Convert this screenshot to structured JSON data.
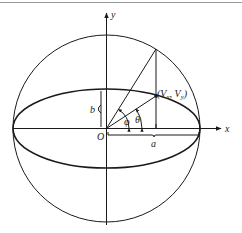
{
  "figure": {
    "type": "geometry-diagram",
    "colors": {
      "ink": "#1a1a1a",
      "background": "#ffffff",
      "top_rule": "#9a9a9a"
    },
    "axes": {
      "x_label": "x",
      "y_label": "y",
      "origin_label": "O"
    },
    "circle": {
      "cx": 106.5,
      "cy": 128.5,
      "r": 93.5
    },
    "ellipse": {
      "cx": 106.5,
      "cy": 128.5,
      "rx": 93.5,
      "ry": 39.5
    },
    "point": {
      "label_open": "(",
      "label_v1": "V",
      "label_sub1": "x",
      "label_comma": ", ",
      "label_v2": "V",
      "label_sub2": "y",
      "label_close": ")",
      "x": 156,
      "y": 96
    },
    "circle_point": {
      "x": 156,
      "y": 49
    },
    "angles": {
      "phi_label": "φ",
      "theta_label": "θ"
    },
    "dimensions": {
      "semi_major_label": "a",
      "semi_minor_label": "b"
    }
  }
}
